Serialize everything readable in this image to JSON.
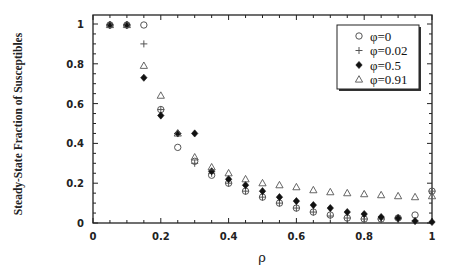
{
  "chart_data": {
    "type": "scatter",
    "title": "",
    "xlabel": "ρ",
    "ylabel": "Steady-State Fraction of Susceptibles",
    "xlim": [
      0,
      1
    ],
    "ylim": [
      0,
      1
    ],
    "xticks": [
      "0",
      "0.2",
      "0.4",
      "0.6",
      "0.8",
      "1"
    ],
    "yticks": [
      "0",
      "0.2",
      "0.4",
      "0.6",
      "0.8",
      "1"
    ],
    "grid": false,
    "legend_position": "upper right",
    "x": [
      0.05,
      0.1,
      0.15,
      0.2,
      0.25,
      0.3,
      0.35,
      0.4,
      0.45,
      0.5,
      0.55,
      0.6,
      0.65,
      0.7,
      0.75,
      0.8,
      0.85,
      0.9,
      0.95,
      1.0
    ],
    "series": [
      {
        "name": "φ=0",
        "marker": "open-circle",
        "values": [
          1.0,
          1.0,
          1.0,
          0.57,
          0.38,
          0.31,
          0.24,
          0.2,
          0.16,
          0.13,
          0.1,
          0.075,
          0.055,
          0.04,
          0.025,
          0.02,
          0.02,
          0.025,
          0.04,
          0.16
        ]
      },
      {
        "name": "φ=0.02",
        "marker": "plus",
        "values": [
          1.0,
          1.0,
          0.9,
          0.57,
          0.45,
          0.3,
          0.25,
          0.2,
          0.16,
          0.13,
          0.1,
          0.075,
          0.055,
          0.035,
          0.025,
          0.02,
          0.02,
          0.02,
          0.01,
          0.16
        ]
      },
      {
        "name": "φ=0.5",
        "marker": "filled-diamond",
        "values": [
          1.0,
          1.0,
          0.73,
          0.54,
          0.45,
          0.45,
          0.26,
          0.22,
          0.19,
          0.16,
          0.13,
          0.11,
          0.09,
          0.075,
          0.055,
          0.045,
          0.03,
          0.025,
          0.01,
          0.005
        ]
      },
      {
        "name": "φ=0.91",
        "marker": "open-triangle",
        "values": [
          1.0,
          1.0,
          0.79,
          0.64,
          0.45,
          0.33,
          0.28,
          0.25,
          0.22,
          0.2,
          0.19,
          0.18,
          0.165,
          0.155,
          0.15,
          0.145,
          0.14,
          0.135,
          0.13,
          0.135
        ]
      }
    ]
  },
  "legend": {
    "items": [
      {
        "label": "φ=0",
        "marker": "open-circle"
      },
      {
        "label": "φ=0.02",
        "marker": "plus"
      },
      {
        "label": "φ=0.5",
        "marker": "filled-diamond"
      },
      {
        "label": "φ=0.91",
        "marker": "open-triangle"
      }
    ]
  },
  "colors": {
    "axis": "#222222",
    "marker_open": "#555555",
    "marker_filled": "#111111"
  }
}
